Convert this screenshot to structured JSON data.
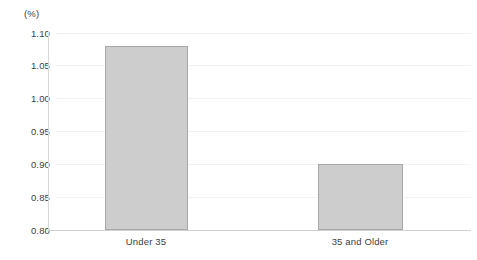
{
  "chart_data": {
    "type": "bar",
    "title": "",
    "subtitle": "",
    "xlabel": "",
    "ylabel": "",
    "unit_label": "(%)",
    "categories": [
      "Under 35",
      "35 and Older"
    ],
    "values": [
      1.08,
      0.9
    ],
    "series": [
      {
        "name": "",
        "values": [
          1.08,
          0.9
        ]
      }
    ],
    "ylim": [
      0.8,
      1.1
    ],
    "ytick_step": 0.05,
    "ytick_labels": [
      "1.10",
      "1.05",
      "1.00",
      "0.95",
      "0.90",
      "0.85",
      "0.80"
    ],
    "ytick_values": [
      1.1,
      1.05,
      1.0,
      0.95,
      0.9,
      0.85,
      0.8
    ],
    "grid": true,
    "grid_axis": "y",
    "legend": false,
    "legend_position": "none",
    "annotations": [],
    "colors": {
      "bar_fill": "#cdcdcd",
      "bar_border": "#a8a8a8",
      "gridline": "#f2f2f2",
      "axis": "#d4d4d4",
      "text": "#3e3e3e",
      "background": "#ffffff"
    }
  }
}
